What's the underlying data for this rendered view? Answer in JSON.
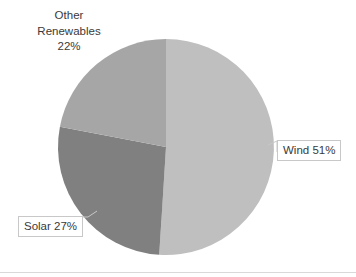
{
  "chart_data": {
    "type": "pie",
    "title": "",
    "categories": [
      "Wind",
      "Solar",
      "Other Renewables"
    ],
    "values": [
      51,
      27,
      22
    ],
    "unit": "%",
    "labels": [
      "Wind 51%",
      "Solar 27%",
      "Other Renewables 22%"
    ],
    "colors": [
      "#bfbfbf",
      "#808080",
      "#a6a6a6"
    ],
    "legend": "none",
    "grid": false,
    "start_angle_deg": 0,
    "direction": "clockwise",
    "center": {
      "x": 166,
      "y": 147
    },
    "radius": 108,
    "slices": [
      {
        "name": "Wind",
        "value": 51,
        "label": "Wind 51%",
        "color": "#bfbfbf",
        "start_deg": 0,
        "end_deg": 183.6,
        "label_style": "callout-box"
      },
      {
        "name": "Solar",
        "value": 27,
        "label": "Solar 27%",
        "color": "#808080",
        "start_deg": 183.6,
        "end_deg": 280.8,
        "label_style": "callout-box"
      },
      {
        "name": "Other Renewables",
        "value": 22,
        "label": "Other Renewables 22%",
        "color": "#a6a6a6",
        "start_deg": 280.8,
        "end_deg": 360,
        "label_style": "plain-text"
      }
    ]
  },
  "labels": {
    "wind": "Wind 51%",
    "solar": "Solar 27%",
    "other_line1": "Other",
    "other_line2": "Renewables",
    "other_line3": "22%"
  },
  "colors": {
    "wind_slice": "#bfbfbf",
    "solar_slice": "#808080",
    "other_slice": "#a6a6a6",
    "text": "#3a3a3a",
    "callout_border": "#c8c8c8",
    "leader_line": "#c8c8c8",
    "background": "#ffffff",
    "bottom_rule": "#d9d9d9"
  }
}
